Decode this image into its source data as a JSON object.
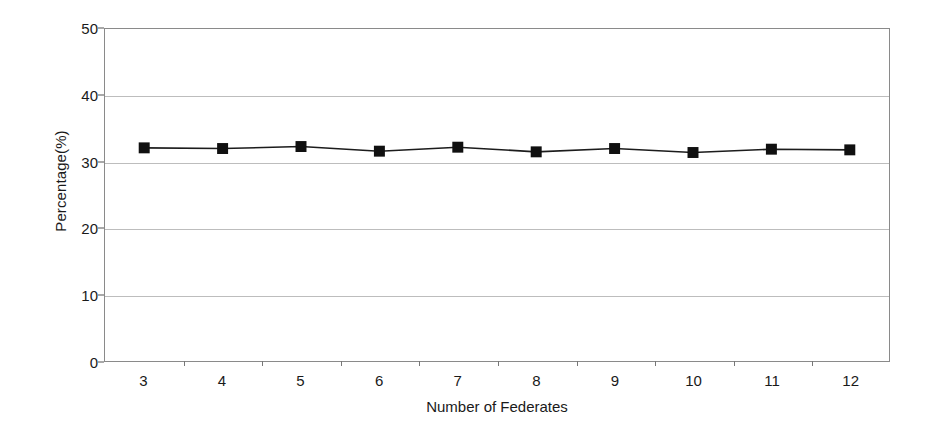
{
  "chart_data": {
    "type": "line",
    "title": "",
    "xlabel": "Number of Federates",
    "ylabel": "Percentage(%)",
    "categories": [
      "3",
      "4",
      "5",
      "6",
      "7",
      "8",
      "9",
      "10",
      "11",
      "12"
    ],
    "values": [
      32.1,
      32.0,
      32.3,
      31.6,
      32.2,
      31.5,
      32.0,
      31.4,
      31.9,
      31.8
    ],
    "series": [
      {
        "name": "Percentage",
        "values": [
          32.1,
          32.0,
          32.3,
          31.6,
          32.2,
          31.5,
          32.0,
          31.4,
          31.9,
          31.8
        ],
        "marker": "filled-square",
        "marker_color": "#101010",
        "line_color": "#1c1c1c"
      }
    ],
    "ylim": [
      0,
      50
    ],
    "y_ticks": [
      0,
      10,
      20,
      30,
      40,
      50
    ],
    "y_tick_labels": [
      "0",
      "10",
      "20",
      "30",
      "40",
      "50"
    ],
    "grid": {
      "horizontal": true,
      "vertical": false,
      "color": "#bdbdbd"
    },
    "legend": {
      "visible": false,
      "position": "none"
    },
    "frame": {
      "border_color": "#8a8a8a",
      "background": "#ffffff"
    }
  }
}
